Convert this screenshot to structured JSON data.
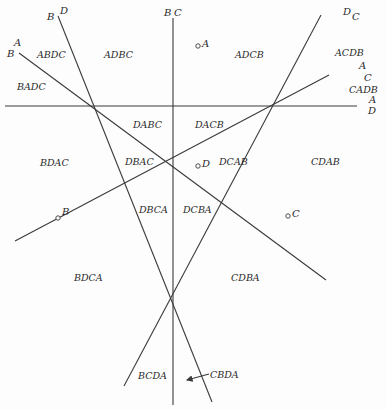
{
  "diagram": {
    "type": "hyperplane arrangement of rankings",
    "lines": [
      {
        "id": "AD",
        "end_labels": [
          "A",
          "D"
        ],
        "x1": 5,
        "y1": 106,
        "x2": 357,
        "y2": 106
      },
      {
        "id": "BC",
        "end_labels": [
          "B",
          "C"
        ],
        "x1": 173,
        "y1": 18,
        "x2": 173,
        "y2": 405
      },
      {
        "id": "BD",
        "end_labels": [
          "B",
          "D"
        ],
        "x1": 58,
        "y1": 16,
        "x2": 212,
        "y2": 402
      },
      {
        "id": "AB",
        "end_labels": [
          "A",
          "B"
        ],
        "x1": 19,
        "y1": 53,
        "x2": 326,
        "y2": 280
      },
      {
        "id": "DC",
        "end_labels": [
          "D",
          "C"
        ],
        "x1": 321,
        "y1": 15,
        "x2": 124,
        "y2": 386
      },
      {
        "id": "AC",
        "end_labels": [
          "A",
          "C"
        ],
        "x1": 329,
        "y1": 75,
        "x2": 15,
        "y2": 241
      }
    ],
    "line_labels": [
      {
        "text": "B",
        "x": 47,
        "y": 20
      },
      {
        "text": "D",
        "x": 60,
        "y": 14
      },
      {
        "text": "B",
        "x": 164,
        "y": 16
      },
      {
        "text": "C",
        "x": 174,
        "y": 16
      },
      {
        "text": "D",
        "x": 343,
        "y": 15
      },
      {
        "text": "C",
        "x": 352,
        "y": 20
      },
      {
        "text": "A",
        "x": 14,
        "y": 46
      },
      {
        "text": "B",
        "x": 7,
        "y": 57
      },
      {
        "text": "A",
        "x": 359,
        "y": 69
      },
      {
        "text": "C",
        "x": 364,
        "y": 81
      },
      {
        "text": "A",
        "x": 369,
        "y": 103
      },
      {
        "text": "D",
        "x": 368,
        "y": 114
      }
    ],
    "points": [
      {
        "label": "A",
        "cx": 198,
        "cy": 46,
        "lx": 202,
        "ly": 47
      },
      {
        "label": "D",
        "cx": 198,
        "cy": 166,
        "lx": 202,
        "ly": 167
      },
      {
        "label": "B",
        "cx": 58,
        "cy": 218,
        "lx": 62,
        "ly": 215
      },
      {
        "label": "C",
        "cx": 288,
        "cy": 216,
        "lx": 292,
        "ly": 217
      }
    ],
    "regions": [
      {
        "text": "ABDC",
        "x": 37,
        "y": 58
      },
      {
        "text": "ADBC",
        "x": 104,
        "y": 58
      },
      {
        "text": "ADCB",
        "x": 235,
        "y": 58
      },
      {
        "text": "ACDB",
        "x": 335,
        "y": 56
      },
      {
        "text": "BADC",
        "x": 17,
        "y": 90
      },
      {
        "text": "CADB",
        "x": 349,
        "y": 93
      },
      {
        "text": "DABC",
        "x": 133,
        "y": 128
      },
      {
        "text": "DACB",
        "x": 195,
        "y": 128
      },
      {
        "text": "BDAC",
        "x": 40,
        "y": 166
      },
      {
        "text": "DBAC",
        "x": 125,
        "y": 165
      },
      {
        "text": "DCAB",
        "x": 219,
        "y": 165
      },
      {
        "text": "CDAB",
        "x": 311,
        "y": 165
      },
      {
        "text": "DBCA",
        "x": 139,
        "y": 213
      },
      {
        "text": "DCBA",
        "x": 183,
        "y": 213
      },
      {
        "text": "BDCA",
        "x": 74,
        "y": 281
      },
      {
        "text": "CDBA",
        "x": 231,
        "y": 281
      },
      {
        "text": "BCDA",
        "x": 138,
        "y": 379
      },
      {
        "text": "CBDA",
        "x": 210,
        "y": 378
      }
    ],
    "arrow": {
      "label": "CBDA",
      "x1": 209,
      "y1": 374,
      "x2": 187,
      "y2": 380
    }
  }
}
